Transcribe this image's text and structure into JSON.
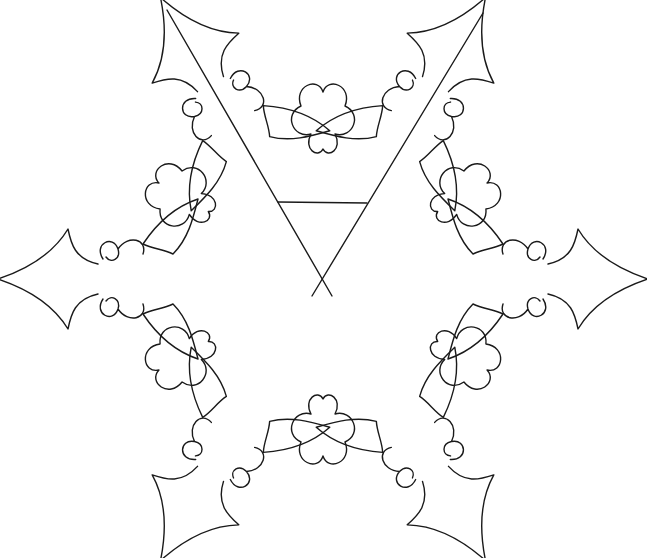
{
  "image": {
    "subject": "six-pointed snowflake ornament line drawing",
    "colors": {
      "background": "#ffffff",
      "stroke": "#1a1a1a"
    }
  }
}
